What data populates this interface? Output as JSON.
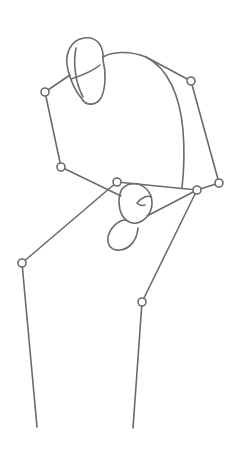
{
  "figure": {
    "stroke_color": "#6b6b6b",
    "stroke_width": 1.6,
    "joint_radius": 4,
    "head": {
      "path": "M 68 70 C 64 55 70 40 84 38 C 97 36 104 46 103 60 C 106 72 106 88 101 98 C 96 106 86 106 82 99 C 76 92 71 82 68 70 Z",
      "mark_a": "M 76 48 C 73 62 75 82 83 97",
      "mark_b": "M 71 79 C 80 76 92 72 100 65"
    },
    "torso": {
      "back": "M 103 57 C 112 52 128 50 146 57 C 168 68 180 96 183 130 C 185 154 184 170 182 188",
      "hip_line": "M 117 182 L 197 190"
    },
    "pelvis": {
      "upper": "M 131 184 C 139 182 147 187 151 196 C 154 207 150 216 142 221 C 134 226 126 222 122 215 C 118 207 118 196 122 189 C 125 186 128 184 131 184 Z",
      "inner_mark": "M 137 203 C 142 197 148 195 151 197 M 137 203 C 139 205 142 206 145 205",
      "lower": "M 126 220 C 118 220 110 228 108 237 C 107 246 112 251 120 250 C 130 249 137 240 138 228"
    },
    "joints": [
      {
        "name": "left-shoulder",
        "x": 45,
        "y": 92
      },
      {
        "name": "right-shoulder",
        "x": 191,
        "y": 81
      },
      {
        "name": "left-elbow",
        "x": 61,
        "y": 167
      },
      {
        "name": "left-hip",
        "x": 117,
        "y": 182
      },
      {
        "name": "right-hip",
        "x": 197,
        "y": 190
      },
      {
        "name": "right-wrist",
        "x": 219,
        "y": 183
      },
      {
        "name": "left-knee",
        "x": 22,
        "y": 263
      },
      {
        "name": "right-knee",
        "x": 142,
        "y": 302
      }
    ],
    "bones": [
      {
        "name": "shoulder-to-head",
        "from": [
          45,
          92
        ],
        "to": [
          70,
          75
        ]
      },
      {
        "name": "upper-arm-left",
        "from": [
          45,
          92
        ],
        "to": [
          61,
          167
        ]
      },
      {
        "name": "forearm-left",
        "from": [
          61,
          167
        ],
        "to": [
          121,
          196
        ]
      },
      {
        "name": "shoulder-line-right",
        "from": [
          146,
          57
        ],
        "to": [
          191,
          81
        ]
      },
      {
        "name": "upper-arm-right",
        "from": [
          191,
          81
        ],
        "to": [
          219,
          183
        ]
      },
      {
        "name": "forearm-right",
        "from": [
          219,
          183
        ],
        "to": [
          197,
          190
        ]
      },
      {
        "name": "thigh-left",
        "from": [
          117,
          182
        ],
        "to": [
          22,
          263
        ]
      },
      {
        "name": "hip-cross",
        "from": [
          197,
          190
        ],
        "to": [
          147,
          216
        ]
      },
      {
        "name": "shin-left",
        "from": [
          22,
          263
        ],
        "to": [
          37,
          427
        ]
      },
      {
        "name": "thigh-right",
        "from": [
          197,
          190
        ],
        "to": [
          142,
          302
        ]
      },
      {
        "name": "shin-right",
        "from": [
          142,
          302
        ],
        "to": [
          133,
          428
        ]
      }
    ]
  }
}
